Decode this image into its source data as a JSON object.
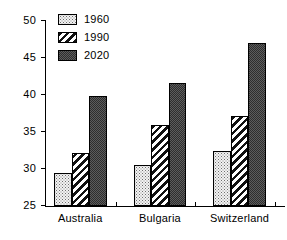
{
  "chart_data": {
    "type": "bar",
    "title": "",
    "subtitle": "",
    "xlabel": "",
    "ylabel": "",
    "categories": [
      "Australia",
      "Bulgaria",
      "Switzerland"
    ],
    "series": [
      {
        "name": "1960",
        "values": [
          29.5,
          30.5,
          32.5
        ],
        "pattern": "light-stipple",
        "color": "#f2f2f2"
      },
      {
        "name": "1990",
        "values": [
          32.2,
          36.0,
          37.2
        ],
        "pattern": "diagonal-hatch",
        "color": "#ffffff"
      },
      {
        "name": "2020",
        "values": [
          39.8,
          41.6,
          47.0
        ],
        "pattern": "dark-checker",
        "color": "#5c5c5c"
      }
    ],
    "ylim": [
      25,
      50
    ],
    "yticks": [
      25,
      30,
      35,
      40,
      45,
      50
    ],
    "ytick_labels": [
      "25",
      "30",
      "35",
      "40",
      "45",
      "50"
    ],
    "grid": false,
    "legend_position": "top-left",
    "annotations": []
  },
  "legend": {
    "entries": [
      {
        "label": "1960"
      },
      {
        "label": "1990"
      },
      {
        "label": "2020"
      }
    ]
  }
}
